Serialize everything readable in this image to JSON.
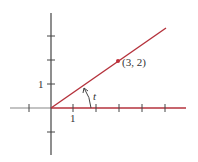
{
  "diagram": {
    "type": "coordinate-plane-angle",
    "origin": [
      0,
      0
    ],
    "point": {
      "x": 3,
      "y": 2,
      "label": "(3, 2)"
    },
    "angle_label": "t",
    "x_tick_label": "1",
    "y_tick_label": "1",
    "colors": {
      "ray": "#c0303a",
      "axis": "#555555",
      "point": "#c0303a"
    }
  }
}
